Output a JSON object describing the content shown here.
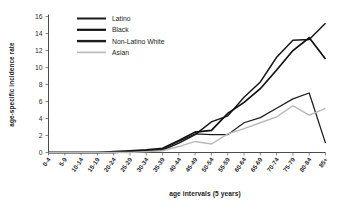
{
  "chart_data": {
    "type": "line",
    "title": "",
    "xlabel": "age intervals (5 years)",
    "ylabel": "age-specific incidence rate",
    "categories": [
      "0-4",
      "5-9",
      "10-14",
      "15-19",
      "20-24",
      "25-29",
      "30-34",
      "35-39",
      "40-44",
      "45-49",
      "50-54",
      "55-59",
      "60-64",
      "65-69",
      "70-74",
      "75-79",
      "80-84",
      "85+"
    ],
    "xtick_labels": [
      "0-4",
      "5-9",
      "10-14",
      "15-19",
      "20-24",
      "25-29",
      "30-34",
      "35-39",
      "40-44",
      "45-49",
      "50-54",
      "55-59",
      "60-64",
      "65-69",
      "70-74",
      "75-79",
      "80-84",
      "85+"
    ],
    "ytick_labels": [
      "0",
      "2",
      "4",
      "6",
      "8",
      "10",
      "12",
      "14",
      "16"
    ],
    "ytick_values": [
      0,
      2,
      4,
      6,
      8,
      10,
      12,
      14,
      16
    ],
    "ylim": [
      0,
      16
    ],
    "grid": false,
    "legend_position": "top-center",
    "series": [
      {
        "name": "Latino",
        "color": "#1a1a1a",
        "width": 1.5,
        "values": [
          0,
          0,
          0,
          0,
          0,
          0.1,
          0.2,
          0.3,
          1.1,
          2.1,
          3.6,
          4.3,
          6.5,
          8.3,
          11.2,
          13.2,
          13.3,
          15.2
        ]
      },
      {
        "name": "Black",
        "color": "#111111",
        "width": 1.7,
        "values": [
          0,
          0,
          0,
          0,
          0.1,
          0.2,
          0.3,
          0.5,
          1.4,
          2.4,
          2.6,
          4.6,
          5.9,
          7.5,
          9.7,
          12.0,
          13.5,
          11.0
        ]
      },
      {
        "name": "Non-Latino White",
        "color": "#1d1d1d",
        "width": 1.3,
        "values": [
          0,
          0,
          0,
          0,
          0,
          0.1,
          0.2,
          0.4,
          1.3,
          2.2,
          2.1,
          2.1,
          3.5,
          4.1,
          5.2,
          6.3,
          7.0,
          1.1
        ]
      },
      {
        "name": "Asian",
        "color": "#b8b8b8",
        "width": 1.4,
        "values": [
          0,
          0,
          0,
          0,
          0,
          0,
          0.1,
          0.2,
          0.7,
          1.3,
          1.0,
          2.2,
          2.8,
          3.5,
          4.2,
          5.5,
          4.4,
          5.2
        ]
      }
    ],
    "legend": [
      {
        "label": "Latino",
        "color": "#1a1a1a",
        "width": 2.0
      },
      {
        "label": "Black",
        "color": "#111111",
        "width": 2.2
      },
      {
        "label": "Non-Latino White",
        "color": "#1d1d1d",
        "width": 2.4
      },
      {
        "label": "Asian",
        "color": "#b8b8b8",
        "width": 1.6
      }
    ]
  }
}
